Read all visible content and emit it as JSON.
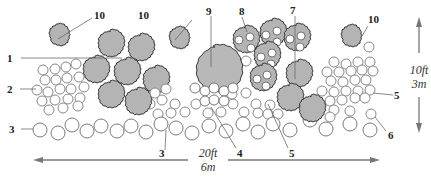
{
  "diagram": {
    "dimensions": {
      "width_label_ft": "20ft",
      "width_label_m": "6m",
      "height_label_ft": "10ft",
      "height_label_m": "3m"
    },
    "colors": {
      "shrub_fill": "#b4b4b4",
      "outline": "#3a3a3a",
      "ring_stroke": "#7a7a7a",
      "arrow": "#777777"
    },
    "labels": [
      {
        "id": "1",
        "text": "1"
      },
      {
        "id": "2",
        "text": "2"
      },
      {
        "id": "3a",
        "text": "3"
      },
      {
        "id": "3b",
        "text": "3"
      },
      {
        "id": "4",
        "text": "4"
      },
      {
        "id": "5a",
        "text": "5"
      },
      {
        "id": "5b",
        "text": "5"
      },
      {
        "id": "6",
        "text": "6"
      },
      {
        "id": "7",
        "text": "7"
      },
      {
        "id": "8",
        "text": "8"
      },
      {
        "id": "9",
        "text": "9"
      },
      {
        "id": "10a",
        "text": "10"
      },
      {
        "id": "10b",
        "text": "10"
      },
      {
        "id": "10c",
        "text": "10"
      }
    ]
  }
}
